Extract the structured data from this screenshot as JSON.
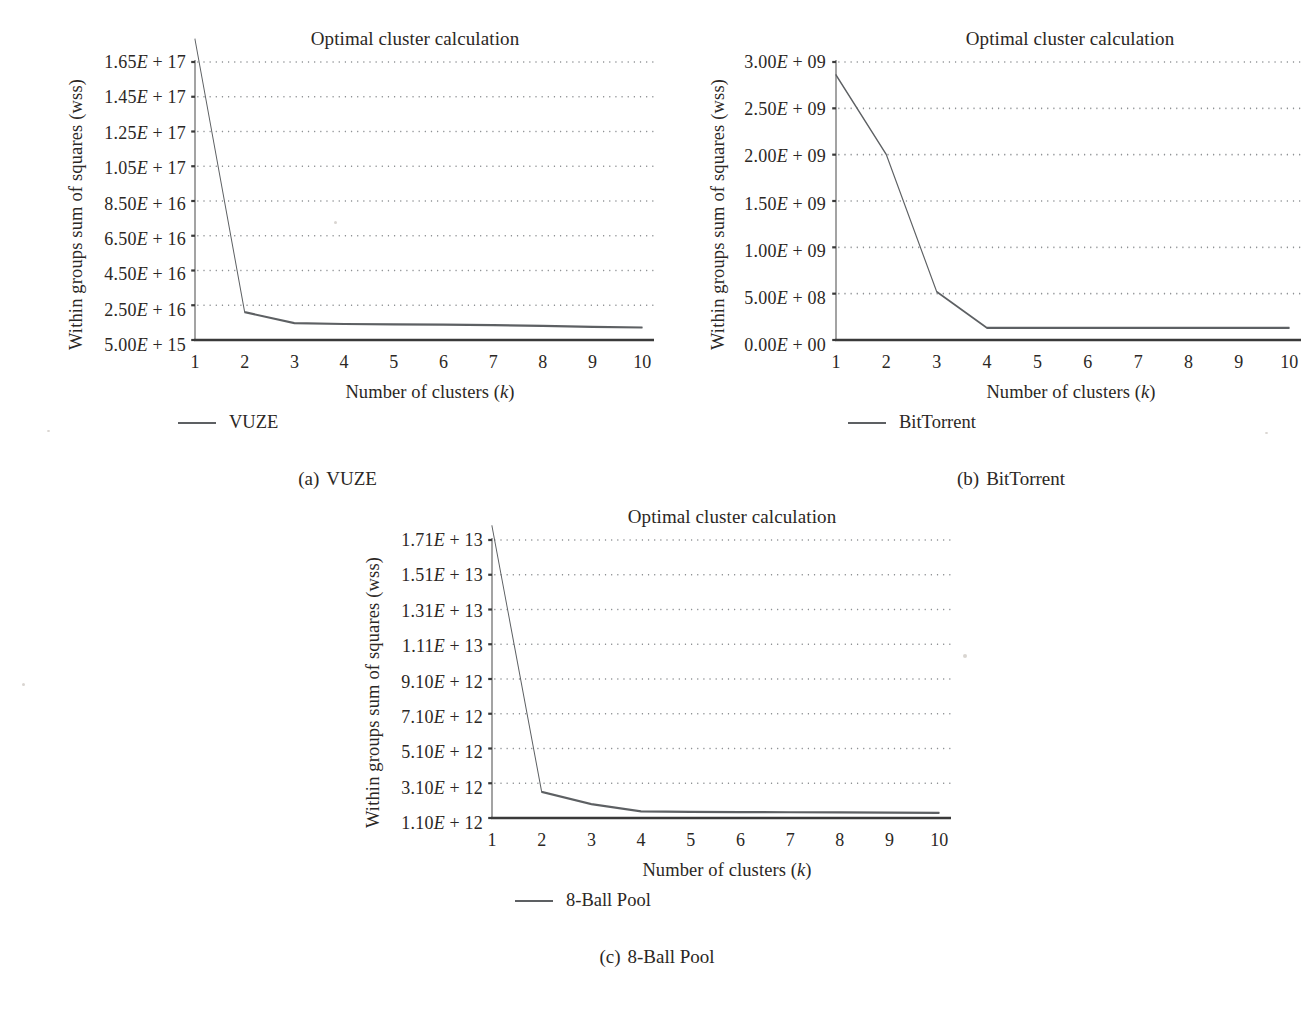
{
  "figure": {
    "panels": [
      {
        "id": "a",
        "tag": "(a)",
        "subcaption": "VUZE",
        "title": "Optimal cluster calculation",
        "legend_label": "VUZE",
        "chart_data": {
          "type": "line",
          "title": "Optimal cluster calculation",
          "xlabel": "Number of clusters (k)",
          "ylabel": "Within groups sum of squares (wss)",
          "series_name": "VUZE",
          "x": [
            1,
            2,
            3,
            4,
            5,
            6,
            7,
            8,
            9,
            10
          ],
          "xticklabels": [
            "1",
            "2",
            "3",
            "4",
            "5",
            "6",
            "7",
            "8",
            "9",
            "10"
          ],
          "values": [
            1.78e+17,
            2.1e+16,
            1.47e+16,
            1.42e+16,
            1.4e+16,
            1.38e+16,
            1.36e+16,
            1.31e+16,
            1.26e+16,
            1.22e+16
          ],
          "yticklabels": [
            "1.65E + 17",
            "1.45E + 17",
            "1.25E + 17",
            "1.05E + 17",
            "8.50E + 16",
            "6.50E + 16",
            "4.50E + 16",
            "2.50E + 16",
            "5.00E + 15"
          ],
          "ytickvalues": [
            1.65e+17,
            1.45e+17,
            1.25e+17,
            1.05e+17,
            8.5e+16,
            6.5e+16,
            4.5e+16,
            2.5e+16,
            5000000000000000.0
          ],
          "ylim": [
            5000000000000000.0,
            1.65e+17
          ],
          "xlim": [
            1,
            10
          ],
          "grid": "horizontal-dotted",
          "legend_position": "below-left",
          "line_color": "#5d6063"
        }
      },
      {
        "id": "b",
        "tag": "(b)",
        "subcaption": "BitTorrent",
        "title": "Optimal cluster calculation",
        "legend_label": "BitTorrent",
        "chart_data": {
          "type": "line",
          "title": "Optimal cluster calculation",
          "xlabel": "Number of clusters (k)",
          "ylabel": "Within groups sum of squares (wss)",
          "series_name": "BitTorrent",
          "x": [
            1,
            2,
            3,
            4,
            5,
            6,
            7,
            8,
            9,
            10
          ],
          "xticklabels": [
            "1",
            "2",
            "3",
            "4",
            "5",
            "6",
            "7",
            "8",
            "9",
            "10"
          ],
          "values": [
            2860000000.0,
            2000000000.0,
            520000000.0,
            130000000.0,
            130000000.0,
            130000000.0,
            130000000.0,
            130000000.0,
            130000000.0,
            130000000.0
          ],
          "yticklabels": [
            "3.00E + 09",
            "2.50E + 09",
            "2.00E + 09",
            "1.50E + 09",
            "1.00E + 09",
            "5.00E + 08",
            "0.00E + 00"
          ],
          "ytickvalues": [
            3000000000.0,
            2500000000.0,
            2000000000.0,
            1500000000.0,
            1000000000.0,
            500000000.0,
            0.0
          ],
          "ylim": [
            0.0,
            3000000000.0
          ],
          "xlim": [
            1,
            10
          ],
          "grid": "horizontal-dotted",
          "legend_position": "below-left",
          "line_color": "#5d6063"
        }
      },
      {
        "id": "c",
        "tag": "(c)",
        "subcaption": "8-Ball Pool",
        "title": "Optimal cluster calculation",
        "legend_label": "8-Ball Pool",
        "chart_data": {
          "type": "line",
          "title": "Optimal cluster calculation",
          "xlabel": "Number of clusters (k)",
          "ylabel": "Within groups sum of squares (wss)",
          "series_name": "8-Ball Pool",
          "x": [
            1,
            2,
            3,
            4,
            5,
            6,
            7,
            8,
            9,
            10
          ],
          "xticklabels": [
            "1",
            "2",
            "3",
            "4",
            "5",
            "6",
            "7",
            "8",
            "9",
            "10"
          ],
          "values": [
            17900000000000.0,
            2600000000000.0,
            1900000000000.0,
            1480000000000.0,
            1450000000000.0,
            1440000000000.0,
            1430000000000.0,
            1420000000000.0,
            1410000000000.0,
            1400000000000.0
          ],
          "yticklabels": [
            "1.71E + 13",
            "1.51E + 13",
            "1.31E + 13",
            "1.11E + 13",
            "9.10E + 12",
            "7.10E + 12",
            "5.10E + 12",
            "3.10E + 12",
            "1.10E + 12"
          ],
          "ytickvalues": [
            17100000000000.0,
            15100000000000.0,
            13100000000000.0,
            11100000000000.0,
            9100000000000.0,
            7100000000000.0,
            5100000000000.0,
            3100000000000.0,
            1100000000000.0
          ],
          "ylim": [
            1100000000000.0,
            17100000000000.0
          ],
          "xlim": [
            1,
            10
          ],
          "grid": "horizontal-dotted",
          "legend_position": "below-left",
          "line_color": "#5d6063"
        }
      }
    ]
  }
}
